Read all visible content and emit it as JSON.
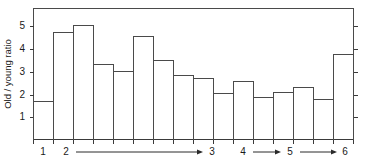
{
  "chart_data": {
    "type": "bar",
    "title": "",
    "subtitle": "",
    "xlabel": "",
    "ylabel": "Old / young ratio",
    "ylim": [
      0,
      5.8
    ],
    "yticks": [
      1,
      2,
      3,
      4,
      5
    ],
    "ytick_labels": [
      "1",
      "2",
      "3",
      "4",
      "5"
    ],
    "grid": false,
    "legend": null,
    "bar_style": "outline-only",
    "bar_count": 16,
    "categories": [
      "1",
      "2",
      "3",
      "4",
      "5",
      "6",
      "7",
      "8",
      "9",
      "10",
      "11",
      "12",
      "13",
      "14",
      "15",
      "16"
    ],
    "values": [
      1.7,
      4.75,
      5.05,
      3.3,
      3.0,
      4.55,
      3.5,
      2.85,
      2.7,
      2.05,
      2.55,
      1.85,
      2.1,
      2.3,
      1.75,
      3.75
    ],
    "x_axis_stage_labels": [
      "1",
      "2",
      "3",
      "4",
      "5",
      "6"
    ],
    "x_axis_stage_positions": [
      43,
      66,
      212,
      243,
      290,
      345
    ],
    "x_axis_arrows": [
      {
        "from_label": "2",
        "to_label": "3",
        "x_start": 76,
        "x_end": 203
      },
      {
        "from_label": "4",
        "to_label": "5",
        "x_start": 253,
        "x_end": 281
      },
      {
        "from_label": "5",
        "to_label": "6",
        "x_start": 300,
        "x_end": 337
      }
    ],
    "axis_note": "Horizontal axis marked with stage numbers 1 through 6, arrows spanning ranges between stages",
    "colors": {
      "line": "#4a4a4a",
      "text": "#1a1a1a",
      "background": "#ffffff"
    }
  },
  "figure": {
    "ylabel": "Old / young ratio",
    "ytick_labels": [
      "1",
      "2",
      "3",
      "4",
      "5"
    ],
    "xtick_labels": [
      "1",
      "2",
      "3",
      "4",
      "5",
      "6"
    ]
  }
}
